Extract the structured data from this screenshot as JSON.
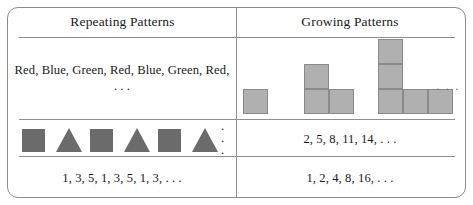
{
  "figure": {
    "type": "two-column-comparison-table",
    "columns": [
      {
        "key": "repeating",
        "header": "Repeating Patterns"
      },
      {
        "key": "growing",
        "header": "Growing Patterns"
      }
    ],
    "border_color": "#8c8c8c",
    "rule_color": "#8f8f8f",
    "text_color": "#1a1a1a"
  },
  "repeating": {
    "header": "Repeating Patterns",
    "row1_text": "Red, Blue, Green, Red, Blue, Green, Red, . . .",
    "row2_shapes": [
      {
        "kind": "square",
        "name": "square-shape"
      },
      {
        "kind": "triangle",
        "name": "triangle-shape"
      },
      {
        "kind": "square",
        "name": "square-shape"
      },
      {
        "kind": "triangle",
        "name": "triangle-shape"
      },
      {
        "kind": "square",
        "name": "square-shape"
      },
      {
        "kind": "triangle",
        "name": "triangle-shape"
      }
    ],
    "row2_shape_color": "#6b6b6b",
    "row2_ellipsis": ". . .",
    "row3_text": "1, 3, 5, 1, 3, 5, 1, 3, . . ."
  },
  "growing": {
    "header": "Growing Patterns",
    "row1_diagram": {
      "description": "Sequence of L-shaped square figures growing in size",
      "square_fill": "#b0b0b0",
      "square_stroke": "#8a8a8a",
      "ellipsis": ". . .",
      "terms": [
        {
          "index": 1,
          "count": 1,
          "column_height": 1,
          "arm_length": 0
        },
        {
          "index": 2,
          "count": 3,
          "column_height": 2,
          "arm_length": 1
        },
        {
          "index": 3,
          "count": 5,
          "column_height": 3,
          "arm_length": 2
        }
      ]
    },
    "row2_text": "2, 5, 8, 11, 14, . . .",
    "row3_text": "1, 2, 4, 8, 16, . . ."
  }
}
